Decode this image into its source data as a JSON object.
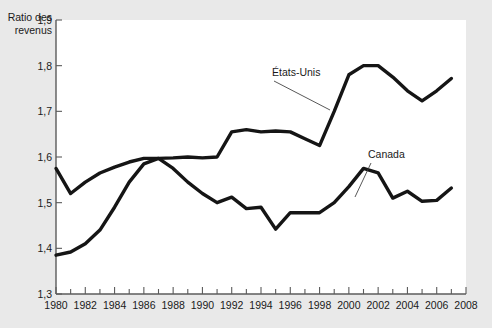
{
  "chart_data": {
    "type": "line",
    "title": "",
    "ylabel": "Ratio des revenus",
    "ylabel_line1": "Ratio des",
    "ylabel_line2": "revenus",
    "xlabel": "",
    "ylim": [
      1.3,
      1.9
    ],
    "xlim": [
      1980,
      2008
    ],
    "grid": false,
    "legend_position": "inline-annotation",
    "y_ticks": [
      1.3,
      1.4,
      1.5,
      1.6,
      1.7,
      1.8,
      1.9
    ],
    "y_tick_labels": [
      "1,3",
      "1,4",
      "1,5",
      "1,6",
      "1,7",
      "1,8",
      "1,9"
    ],
    "x_ticks_major": [
      1980,
      1982,
      1984,
      1986,
      1988,
      1990,
      1992,
      1994,
      1996,
      1998,
      2000,
      2002,
      2004,
      2006,
      2008
    ],
    "x_tick_labels": [
      "1980",
      "1982",
      "1984",
      "1986",
      "1988",
      "1990",
      "1992",
      "1994",
      "1996",
      "1998",
      "2000",
      "2002",
      "2004",
      "2006",
      "2008"
    ],
    "x_ticks_minor": [
      1981,
      1983,
      1985,
      1987,
      1989,
      1991,
      1993,
      1995,
      1997,
      1999,
      2001,
      2003,
      2005,
      2007
    ],
    "x": [
      1980,
      1981,
      1982,
      1983,
      1984,
      1985,
      1986,
      1987,
      1988,
      1989,
      1990,
      1991,
      1992,
      1993,
      1994,
      1995,
      1996,
      1997,
      1998,
      1999,
      2000,
      2001,
      2002,
      2003,
      2004,
      2005,
      2006,
      2007
    ],
    "series": [
      {
        "name": "États-Unis",
        "color": "#151515",
        "values": [
          1.575,
          1.52,
          1.545,
          1.565,
          1.578,
          1.589,
          1.597,
          1.597,
          1.598,
          1.6,
          1.598,
          1.6,
          1.655,
          1.66,
          1.655,
          1.657,
          1.655,
          1.64,
          1.625,
          1.7,
          1.78,
          1.8,
          1.8,
          1.775,
          1.745,
          1.723,
          1.745,
          1.772
        ]
      },
      {
        "name": "Canada",
        "color": "#151515",
        "values": [
          1.385,
          1.392,
          1.41,
          1.44,
          1.49,
          1.545,
          1.585,
          1.597,
          1.575,
          1.545,
          1.52,
          1.5,
          1.512,
          1.487,
          1.49,
          1.442,
          1.478,
          1.478,
          1.478,
          1.5,
          1.535,
          1.575,
          1.565,
          1.51,
          1.525,
          1.503,
          1.505,
          1.532
        ]
      }
    ],
    "annotations": [
      {
        "label": "États-Unis",
        "text_x": 272,
        "text_y": 76,
        "leader_from_x": 274,
        "leader_from_y": 81,
        "leader_to_x": 330,
        "leader_to_y": 110
      },
      {
        "label": "Canada",
        "text_x": 368,
        "text_y": 158,
        "leader_from_x": 371,
        "leader_from_y": 163,
        "leader_to_x": 355,
        "leader_to_y": 197
      }
    ]
  }
}
